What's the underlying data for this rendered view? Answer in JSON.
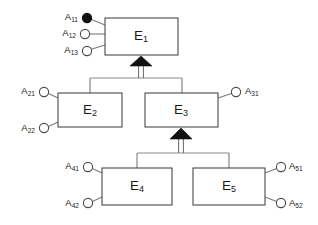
{
  "diagram": {
    "type": "entity-relationship-diagram",
    "background_color": "#ffffff",
    "line_color": "#7a7a7a",
    "box_stroke_color": "#4a4a4a",
    "text_color": "#1a1a1a",
    "key_attribute_fill": "#111111",
    "entities": [
      {
        "id": "E1",
        "label_base": "E",
        "label_sub": "1",
        "level": "superclass",
        "box": {
          "x": 105,
          "y": 18,
          "width": 73,
          "height": 37
        },
        "label_x": 141,
        "label_y": 36
      },
      {
        "id": "E2",
        "label_base": "E",
        "label_sub": "2",
        "level": "subclass",
        "box": {
          "x": 58,
          "y": 93,
          "width": 64,
          "height": 34
        },
        "label_x": 90,
        "label_y": 110
      },
      {
        "id": "E3",
        "label_base": "E",
        "label_sub": "3",
        "level": "subclass",
        "box": {
          "x": 145,
          "y": 93,
          "width": 73,
          "height": 34
        },
        "label_x": 181,
        "label_y": 110
      },
      {
        "id": "E4",
        "label_base": "E",
        "label_sub": "4",
        "level": "sub-subclass",
        "box": {
          "x": 102,
          "y": 168,
          "width": 70,
          "height": 37
        },
        "label_x": 137,
        "label_y": 186
      },
      {
        "id": "E5",
        "label_base": "E",
        "label_sub": "5",
        "level": "sub-subclass",
        "box": {
          "x": 193,
          "y": 168,
          "width": 72,
          "height": 37
        },
        "label_x": 229,
        "label_y": 186
      }
    ],
    "attributes": [
      {
        "id": "A11",
        "label_base": "A",
        "label_sub": "11",
        "owner": "E1",
        "is_key": true,
        "circle": {
          "cx": 87,
          "cy": 18,
          "r": 4.6
        },
        "label_x": 78,
        "label_y": 17,
        "label_anchor": "end",
        "connector": "M91.4,19.6 L105,25"
      },
      {
        "id": "A12",
        "label_base": "A",
        "label_sub": "12",
        "owner": "E1",
        "is_key": false,
        "circle": {
          "cx": 85,
          "cy": 34,
          "r": 4.6
        },
        "label_x": 76,
        "label_y": 33,
        "label_anchor": "end",
        "connector": "M89.6,34 L105,34"
      },
      {
        "id": "A13",
        "label_base": "A",
        "label_sub": "13",
        "owner": "E1",
        "is_key": false,
        "circle": {
          "cx": 87,
          "cy": 51,
          "r": 4.6
        },
        "label_x": 78,
        "label_y": 50,
        "label_anchor": "end",
        "connector": "M91.3,49.3 L105,45"
      },
      {
        "id": "A21",
        "label_base": "A",
        "label_sub": "21",
        "owner": "E2",
        "is_key": false,
        "circle": {
          "cx": 44,
          "cy": 92,
          "r": 4.6
        },
        "label_x": 35,
        "label_y": 91,
        "label_anchor": "end",
        "connector": "M48.4,93.6 L58,98"
      },
      {
        "id": "A22",
        "label_base": "A",
        "label_sub": "22",
        "owner": "E2",
        "is_key": false,
        "circle": {
          "cx": 44,
          "cy": 128,
          "r": 4.6
        },
        "label_x": 35,
        "label_y": 128,
        "label_anchor": "end",
        "connector": "M48.4,126.5 L58,122"
      },
      {
        "id": "A31",
        "label_base": "A",
        "label_sub": "31",
        "owner": "E3",
        "is_key": false,
        "circle": {
          "cx": 236,
          "cy": 92,
          "r": 4.6
        },
        "label_x": 245,
        "label_y": 91,
        "label_anchor": "start",
        "connector": "M231.6,93.6 L218,98"
      },
      {
        "id": "A41",
        "label_base": "A",
        "label_sub": "41",
        "owner": "E4",
        "is_key": false,
        "circle": {
          "cx": 88,
          "cy": 167,
          "r": 4.6
        },
        "label_x": 79,
        "label_y": 166,
        "label_anchor": "end",
        "connector": "M92.4,168.6 L102,173"
      },
      {
        "id": "A42",
        "label_base": "A",
        "label_sub": "42",
        "owner": "E4",
        "is_key": false,
        "circle": {
          "cx": 88,
          "cy": 203,
          "r": 4.6
        },
        "label_x": 79,
        "label_y": 203,
        "label_anchor": "end",
        "connector": "M92.4,201.4 L102,197"
      },
      {
        "id": "A51",
        "label_base": "A",
        "label_sub": "51",
        "owner": "E5",
        "is_key": false,
        "circle": {
          "cx": 281,
          "cy": 167,
          "r": 4.6
        },
        "label_x": 289,
        "label_y": 166,
        "label_anchor": "start",
        "connector": "M276.6,168.6 L265,173"
      },
      {
        "id": "A52",
        "label_base": "A",
        "label_sub": "52",
        "owner": "E5",
        "is_key": false,
        "circle": {
          "cx": 281,
          "cy": 203,
          "r": 4.6
        },
        "label_x": 289,
        "label_y": 203,
        "label_anchor": "start",
        "connector": "M276.6,201.4 L265,197"
      }
    ],
    "generalizations": [
      {
        "id": "gen-to-E1",
        "parent": "E1",
        "children": [
          "E2",
          "E3"
        ],
        "bus_y": 78,
        "bus_x_left": 90,
        "bus_x_right": 182,
        "arrow_x": 141,
        "arrow_tip_y": 56,
        "arrow_base_y": 66,
        "arrow_half_width": 11
      },
      {
        "id": "gen-to-E3",
        "parent": "E3",
        "children": [
          "E4",
          "E5"
        ],
        "bus_y": 153,
        "bus_x_left": 137,
        "bus_x_right": 229,
        "arrow_x": 181,
        "arrow_tip_y": 128,
        "arrow_base_y": 139,
        "arrow_half_width": 11
      }
    ]
  }
}
